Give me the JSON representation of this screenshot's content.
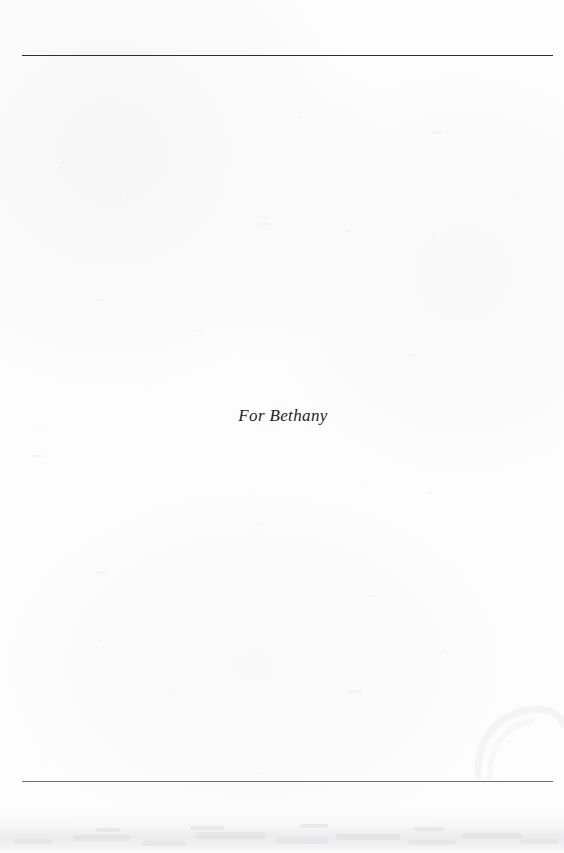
{
  "page": {
    "kind": "book-dedication-page",
    "width": 564,
    "height": 853,
    "background_color": "#fdfdfd"
  },
  "rules": {
    "top": {
      "name": "top-rule",
      "color": "#2e2e30",
      "x_start": 22,
      "x_end": 553,
      "y": 55,
      "thickness": 1.6
    },
    "bottom": {
      "name": "bottom-rule",
      "color": "#6d6d70",
      "x_start": 22,
      "x_end": 553,
      "y": 781,
      "thickness": 1.5
    }
  },
  "dedication": {
    "text": "For Bethany",
    "style": "italic serif",
    "color": "#1d1d1f",
    "font_size_px": 17,
    "align": "center",
    "baseline_y": 423
  },
  "artifacts": {
    "bottom_shadow_band": "#e7e7e9",
    "edge_smudge": "#f1f1f2",
    "speckle_color": "#ededee"
  }
}
